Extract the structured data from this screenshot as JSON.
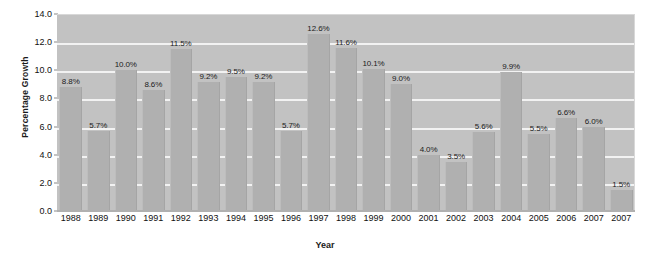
{
  "chart_data": {
    "type": "bar",
    "title": "",
    "xlabel": "Year",
    "ylabel": "Percentage Growth",
    "categories": [
      "1988",
      "1989",
      "1990",
      "1991",
      "1992",
      "1993",
      "1994",
      "1995",
      "1996",
      "1997",
      "1998",
      "1999",
      "2000",
      "2001",
      "2002",
      "2003",
      "2004",
      "2005",
      "2006",
      "2007",
      "2007"
    ],
    "values": [
      8.8,
      5.7,
      10.0,
      8.6,
      11.5,
      9.2,
      9.5,
      9.2,
      5.7,
      12.6,
      11.6,
      10.1,
      9.0,
      4.0,
      3.5,
      5.6,
      9.9,
      5.5,
      6.6,
      6.0,
      1.5
    ],
    "value_labels": [
      "8.8%",
      "5.7%",
      "10.0%",
      "8.6%",
      "11.5%",
      "9.2%",
      "9.5%",
      "9.2%",
      "5.7%",
      "12.6%",
      "11.6%",
      "10.1%",
      "9.0%",
      "4.0%",
      "3.5%",
      "5.6%",
      "9.9%",
      "5.5%",
      "6.6%",
      "6.0%",
      "1.5%"
    ],
    "ylim": [
      0.0,
      14.0
    ],
    "ytick_values": [
      0.0,
      2.0,
      4.0,
      6.0,
      8.0,
      10.0,
      12.0,
      14.0
    ],
    "ytick_labels": [
      "0.0",
      "2.0",
      "4.0",
      "6.0",
      "8.0",
      "10.0",
      "12.0",
      "14.0"
    ],
    "grid": true,
    "gridlines_at": [
      2.0,
      4.0,
      6.0,
      8.0,
      10.0,
      12.0
    ],
    "legend": null,
    "legend_position": "none",
    "colors": {
      "bar": "#b0b0b0",
      "plot_background": "#c2c2c2",
      "gridline": "#f2f2f2",
      "page_background": "#ffffff",
      "text": "#111111"
    }
  }
}
